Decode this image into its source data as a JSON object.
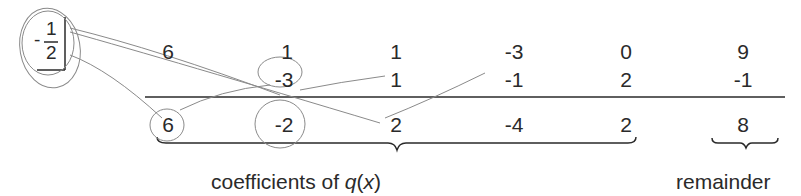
{
  "divisor": {
    "sign": "-",
    "numerator": "1",
    "denominator": "2"
  },
  "rows": {
    "dividend": [
      "6",
      "1",
      "1",
      "-3",
      "0",
      "9"
    ],
    "products": [
      "",
      "-3",
      "1",
      "-1",
      "2",
      "-1"
    ],
    "result": [
      "6",
      "-2",
      "2",
      "-4",
      "2",
      "8"
    ]
  },
  "labels": {
    "quotient": "coefficients of ",
    "quotient_var": "q",
    "quotient_arg_open": "(",
    "quotient_arg": "x",
    "quotient_arg_close": ")",
    "remainder": "remainder"
  },
  "colors": {
    "ink": "#2a2a2a",
    "annotation": "#8a8a8a"
  }
}
